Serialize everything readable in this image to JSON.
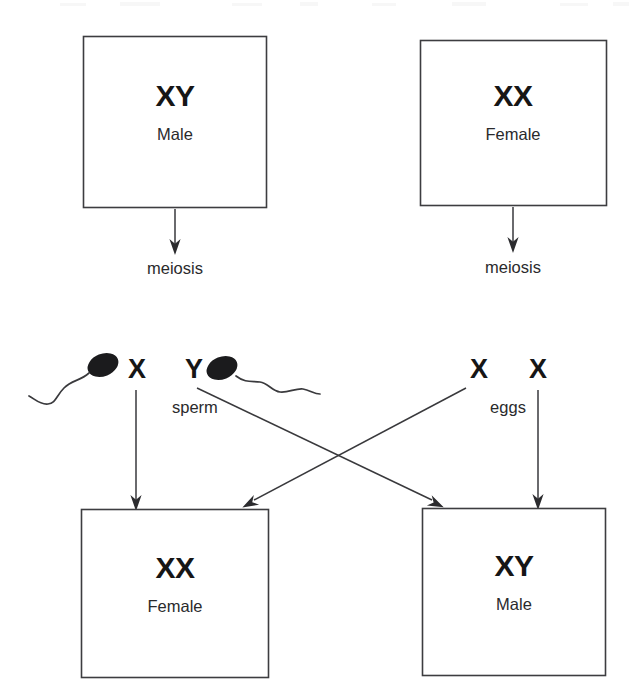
{
  "diagram": {
    "type": "genetics-cross-diagram",
    "colors": {
      "background": "#ffffff",
      "box_border": "#3d3d40",
      "text": "#161616",
      "secondary_text": "#2a2a2c",
      "arrow": "#39393c",
      "sperm_head": "#1b1b1d"
    }
  },
  "parents": {
    "father": {
      "genotype": "XY",
      "sex": "Male",
      "process": "meiosis"
    },
    "mother": {
      "genotype": "XX",
      "sex": "Female",
      "process": "meiosis"
    }
  },
  "gametes": {
    "sperm": {
      "label": "sperm",
      "chromosomes": [
        "X",
        "Y"
      ]
    },
    "eggs": {
      "label": "eggs",
      "chromosomes": [
        "X",
        "X"
      ]
    }
  },
  "offspring": {
    "daughter": {
      "genotype": "XX",
      "sex": "Female"
    },
    "son": {
      "genotype": "XY",
      "sex": "Male"
    }
  }
}
